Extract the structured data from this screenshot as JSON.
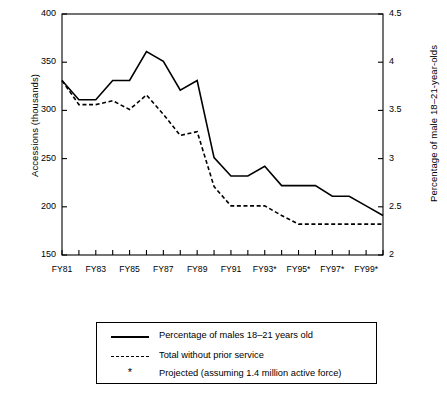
{
  "chart_data": {
    "type": "line",
    "title": "",
    "xlabel": "",
    "ylabel": "Accessions (thousands)",
    "ylabel_right": "Percentage of male 18–21-year-olds",
    "ylim": [
      150,
      400
    ],
    "yticks": [
      "150",
      "200",
      "250",
      "300",
      "350",
      "400"
    ],
    "ylim_right": [
      2,
      4.5
    ],
    "yticks_right": [
      "2",
      "2.5",
      "3",
      "3.5",
      "4",
      "4.5"
    ],
    "grid": false,
    "legend_position": "below-plot",
    "categories": [
      "FY81",
      "FY82",
      "FY83",
      "FY84",
      "FY85",
      "FY86",
      "FY87",
      "FY88",
      "FY89",
      "FY90",
      "FY91",
      "FY92",
      "FY93*",
      "FY94*",
      "FY95*",
      "FY96*",
      "FY97*",
      "FY98*",
      "FY99*",
      "FY00*"
    ],
    "xtick_labels": [
      "FY81",
      "",
      "FY83",
      "",
      "FY85",
      "",
      "FY87",
      "",
      "FY89",
      "",
      "FY91",
      "",
      "FY93*",
      "",
      "FY95*",
      "",
      "FY97*",
      "",
      "FY99*",
      ""
    ],
    "series": [
      {
        "name": "Percentage of males 18–21 years old",
        "style": "solid",
        "axis": "left",
        "values": [
          331,
          311,
          311,
          331,
          331,
          361,
          351,
          321,
          331,
          251,
          232,
          232,
          242,
          222,
          222,
          222,
          211,
          211,
          201,
          191
        ]
      },
      {
        "name": "Total without prior service",
        "style": "dashed",
        "axis": "left",
        "values": [
          331,
          306,
          306,
          310,
          301,
          316,
          296,
          274,
          278,
          221,
          201,
          201,
          201,
          191,
          182,
          182,
          182,
          182,
          182,
          182
        ]
      }
    ]
  },
  "legend": {
    "items": [
      {
        "marker": "solid-line",
        "label": "Percentage of males 18–21 years old"
      },
      {
        "marker": "dashed-line",
        "label": "Total without prior service"
      },
      {
        "marker": "asterisk",
        "symbol": "*",
        "label": "Projected (assuming 1.4 million active force)"
      }
    ]
  },
  "colors": {
    "line": "#000000",
    "axis": "#000000",
    "background": "#ffffff"
  }
}
